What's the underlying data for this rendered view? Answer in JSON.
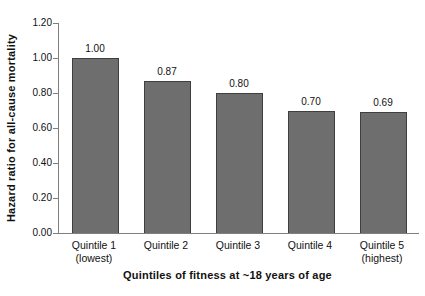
{
  "chart_data": {
    "type": "bar",
    "title": "",
    "categories": [
      "Quintile 1\n(lowest)",
      "Quintile 2",
      "Quintile 3",
      "Quintile 4",
      "Quintile 5\n(highest)"
    ],
    "values": [
      1.0,
      0.87,
      0.8,
      0.7,
      0.69
    ],
    "bar_labels": [
      "1.00",
      "0.87",
      "0.80",
      "0.70",
      "0.69"
    ],
    "xlabel": "Quintiles of fitness at ~18 years of age",
    "ylabel": "Hazard ratio for all-cause mortality",
    "ylim": [
      0,
      1.2
    ],
    "yticks": [
      "0.00",
      "0.20",
      "0.40",
      "0.60",
      "0.80",
      "1.00",
      "1.20"
    ],
    "grid": false,
    "legend": false,
    "colors": {
      "bar_fill": "#6e6e6e",
      "bar_border": "#3f3f3f",
      "axis_line": "#7f7f7f",
      "text": "#111111",
      "background": "#ffffff"
    }
  }
}
